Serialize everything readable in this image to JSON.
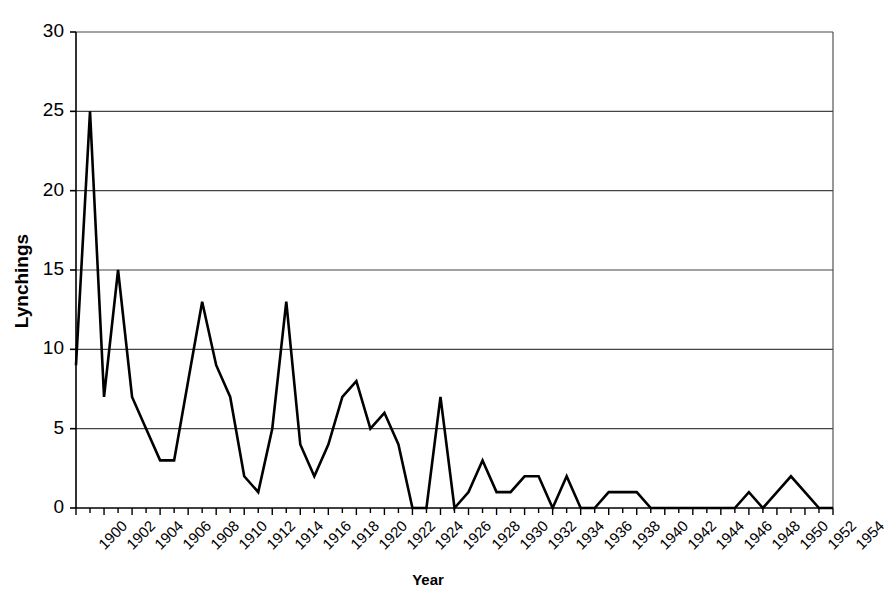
{
  "chart_data": {
    "type": "line",
    "title": "",
    "xlabel": "Year",
    "ylabel": "Lynchings",
    "ylim": [
      0,
      30
    ],
    "yticks": [
      0,
      5,
      10,
      15,
      20,
      25,
      30
    ],
    "xlim": [
      1900,
      1954
    ],
    "xtick_labels": [
      "1900",
      "1902",
      "1904",
      "1906",
      "1908",
      "1910",
      "1912",
      "1914",
      "1916",
      "1918",
      "1920",
      "1922",
      "1924",
      "1926",
      "1928",
      "1930",
      "1932",
      "1934",
      "1936",
      "1938",
      "1940",
      "1942",
      "1944",
      "1946",
      "1948",
      "1950",
      "1952",
      "1954"
    ],
    "xtick_step_years": 2,
    "minor_tick_step_years": 1,
    "grid": "horizontal",
    "legend": "none",
    "line_color": "#000000",
    "line_width": 2.6,
    "x": [
      1900,
      1901,
      1902,
      1903,
      1904,
      1905,
      1906,
      1907,
      1908,
      1909,
      1910,
      1911,
      1912,
      1913,
      1914,
      1915,
      1916,
      1917,
      1918,
      1919,
      1920,
      1921,
      1922,
      1923,
      1924,
      1925,
      1926,
      1927,
      1928,
      1929,
      1930,
      1931,
      1932,
      1933,
      1934,
      1935,
      1936,
      1937,
      1938,
      1939,
      1940,
      1941,
      1942,
      1943,
      1944,
      1945,
      1946,
      1947,
      1948,
      1949,
      1950,
      1951,
      1952,
      1953,
      1954
    ],
    "values": [
      9,
      25,
      7,
      15,
      7,
      5,
      3,
      3,
      8,
      13,
      9,
      7,
      2,
      1,
      5,
      13,
      4,
      2,
      4,
      7,
      8,
      5,
      6,
      4,
      0,
      0,
      7,
      0,
      1,
      3,
      1,
      1,
      2,
      2,
      0,
      2,
      0,
      0,
      1,
      1,
      1,
      0,
      0,
      0,
      0,
      0,
      0,
      0,
      1,
      0,
      1,
      2,
      1,
      0,
      0
    ],
    "series": [
      {
        "name": "Lynchings",
        "values": [
          9,
          25,
          7,
          15,
          7,
          5,
          3,
          3,
          8,
          13,
          9,
          7,
          2,
          1,
          5,
          13,
          4,
          2,
          4,
          7,
          8,
          5,
          6,
          4,
          0,
          0,
          7,
          0,
          1,
          3,
          1,
          1,
          2,
          2,
          0,
          2,
          0,
          0,
          1,
          1,
          1,
          0,
          0,
          0,
          0,
          0,
          0,
          0,
          1,
          0,
          1,
          2,
          1,
          0,
          0
        ]
      }
    ]
  }
}
